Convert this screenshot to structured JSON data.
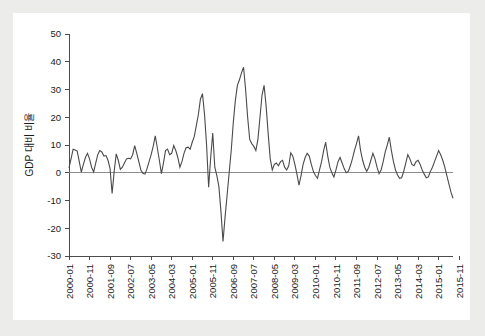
{
  "figure": {
    "background": "#ffffff",
    "page_background": "#ececeb",
    "line_color": "#4a4a4a",
    "axis_color": "#4c4c4c",
    "zero_line_color": "#8d8d8d"
  },
  "chart_data": {
    "type": "line",
    "title": "",
    "xlabel": "",
    "ylabel": "GDP 대비 비율",
    "ylim": [
      -30,
      50
    ],
    "yticks": [
      -30,
      -20,
      -10,
      0,
      10,
      20,
      30,
      40,
      50
    ],
    "ytick_labels": [
      "-30",
      "-20",
      "-10",
      "0",
      "10",
      "20",
      "30",
      "40",
      "50"
    ],
    "grid": false,
    "legend": false,
    "zero_reference_line": 0,
    "xtick_labels": [
      "2000-01",
      "2000-11",
      "2001-09",
      "2002-07",
      "2003-05",
      "2004-03",
      "2005-01",
      "2005-11",
      "2006-09",
      "2007-07",
      "2008-05",
      "2009-03",
      "2010-01",
      "2010-11",
      "2011-09",
      "2012-07",
      "2013-05",
      "2014-03",
      "2015-01",
      "2015-11",
      "2016-09",
      "2017-07"
    ],
    "xtick_indices": [
      0,
      10,
      20,
      30,
      40,
      50,
      60,
      70,
      80,
      90,
      100,
      110,
      120,
      130,
      140,
      150,
      160,
      170,
      180,
      190,
      200,
      210
    ],
    "x_start": "2000-01",
    "x_end": "2018-02",
    "n_points": 218,
    "series": [
      {
        "name": "GDP 대비 비율",
        "values": [
          1.8,
          5.0,
          8.5,
          8.2,
          7.8,
          4.0,
          0.2,
          3.0,
          5.5,
          7.0,
          5.0,
          2.0,
          0.3,
          3.5,
          6.5,
          8.0,
          7.5,
          6.0,
          6.2,
          4.5,
          1.5,
          -7.5,
          0.5,
          6.8,
          4.5,
          1.2,
          2.0,
          3.5,
          5.0,
          5.2,
          5.0,
          6.5,
          9.8,
          7.0,
          4.0,
          1.0,
          -0.2,
          -0.5,
          1.5,
          4.0,
          6.5,
          9.5,
          13.3,
          9.0,
          4.5,
          -0.3,
          3.5,
          8.0,
          8.5,
          6.5,
          7.0,
          9.8,
          8.0,
          5.5,
          2.0,
          4.0,
          7.0,
          9.0,
          9.2,
          8.5,
          11.0,
          13.0,
          17.0,
          21.0,
          26.5,
          28.5,
          21.0,
          10.0,
          -5.2,
          5.5,
          14.3,
          2.0,
          -1.0,
          -5.0,
          -14.0,
          -24.8,
          -16.0,
          -8.0,
          0.0,
          8.0,
          18.0,
          26.0,
          31.5,
          33.5,
          36.0,
          38.0,
          30.0,
          20.0,
          12.0,
          10.5,
          9.5,
          8.0,
          12.0,
          20.0,
          28.0,
          31.5,
          24.0,
          14.0,
          5.0,
          1.0,
          3.0,
          3.5,
          2.5,
          4.0,
          4.5,
          2.0,
          1.0,
          2.5,
          7.2,
          6.0,
          3.0,
          -0.5,
          -4.5,
          -1.0,
          3.0,
          5.5,
          7.0,
          6.0,
          3.0,
          0.5,
          -1.0,
          -2.0,
          1.0,
          4.0,
          8.0,
          11.0,
          6.0,
          2.0,
          0.0,
          -1.5,
          1.0,
          4.0,
          5.5,
          3.5,
          1.5,
          0.0,
          0.5,
          2.5,
          5.0,
          8.0,
          10.5,
          13.3,
          8.0,
          4.5,
          2.0,
          0.5,
          2.0,
          4.5,
          7.0,
          5.0,
          2.0,
          -0.3,
          1.0,
          4.0,
          7.5,
          10.0,
          12.8,
          8.0,
          4.0,
          1.0,
          -0.8,
          -2.0,
          -1.8,
          0.5,
          3.5,
          6.5,
          5.0,
          3.0,
          2.5,
          4.0,
          4.5,
          3.0,
          1.0,
          -0.5,
          -1.8,
          -1.5,
          0.5,
          2.0,
          4.0,
          6.0,
          8.0,
          6.5,
          4.5,
          2.0,
          -1.0,
          -4.0,
          -7.0,
          -9.2
        ]
      }
    ]
  }
}
